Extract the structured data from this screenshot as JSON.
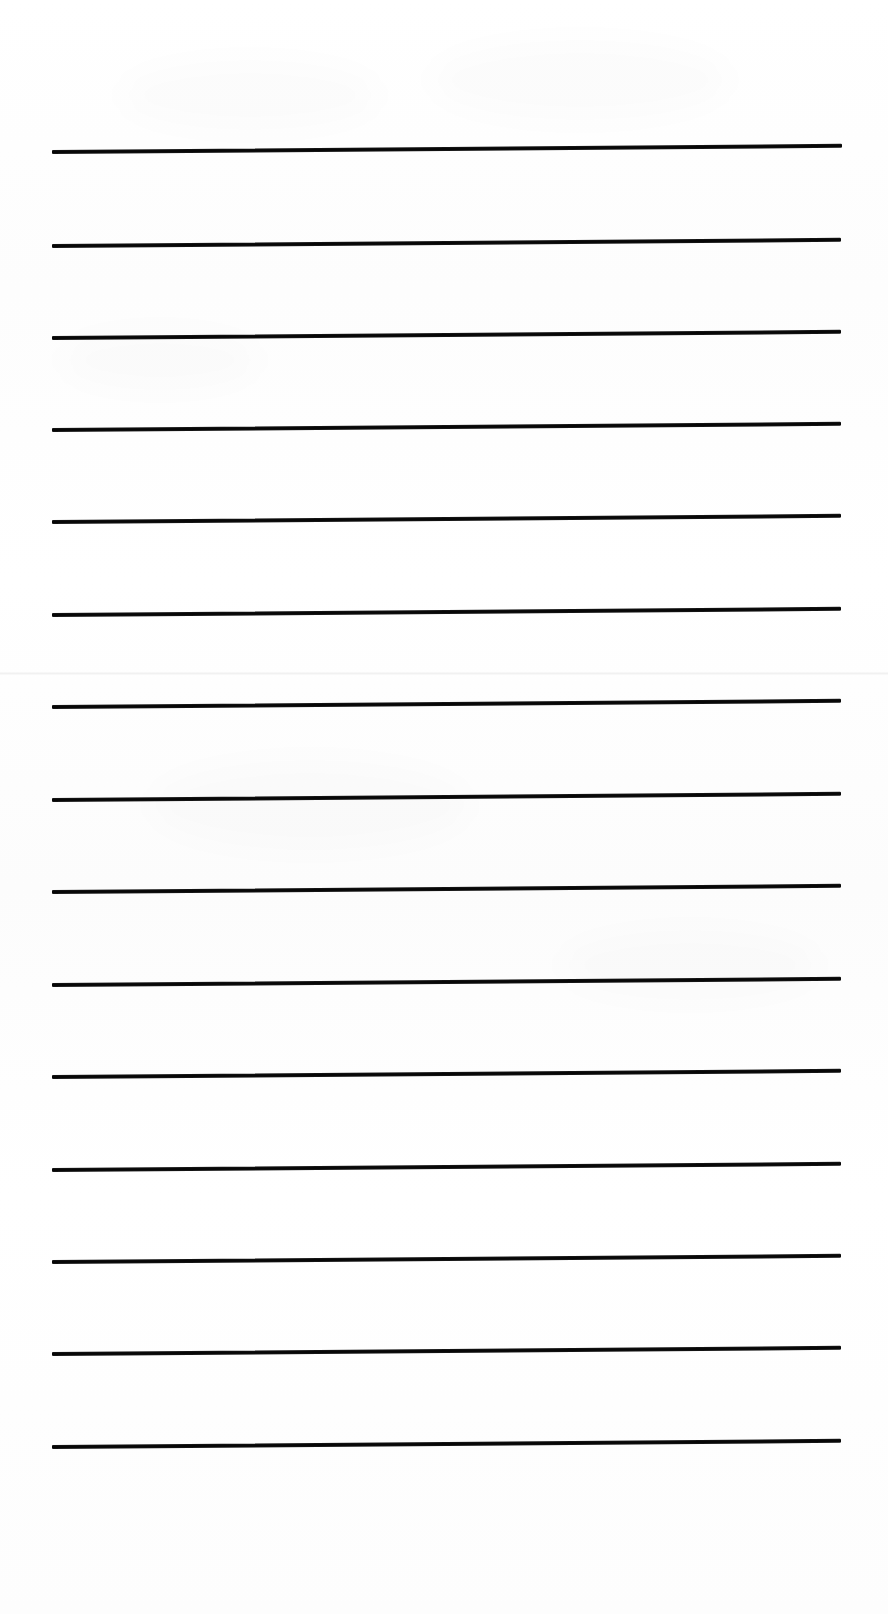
{
  "document": {
    "kind": "lined-paper-sheet",
    "title": "Blank ruled writing paper",
    "orientation": "portrait",
    "page_width": 888,
    "page_height": 1614,
    "background_color": "#ffffff",
    "ink_color": "#141414",
    "has_text_content": false,
    "has_margin_rule": false,
    "has_header": false,
    "has_footer": false
  },
  "ruling": {
    "line_count": 15,
    "line_thickness_px": 4,
    "line_spacing_px": 92.5,
    "left_margin_px": 52,
    "right_margin_px": 44,
    "top_margin_px": 148,
    "bottom_margin_px": 165,
    "tilt_degrees": -0.45,
    "line_color": "#141414",
    "lines": [
      {
        "index": 1,
        "x": 52,
        "y": 150,
        "width": 790
      },
      {
        "index": 2,
        "x": 52,
        "y": 244,
        "width": 789
      },
      {
        "index": 3,
        "x": 52,
        "y": 336,
        "width": 789
      },
      {
        "index": 4,
        "x": 52,
        "y": 428,
        "width": 789
      },
      {
        "index": 5,
        "x": 52,
        "y": 520,
        "width": 789
      },
      {
        "index": 6,
        "x": 52,
        "y": 613,
        "width": 789
      },
      {
        "index": 7,
        "x": 52,
        "y": 705,
        "width": 789
      },
      {
        "index": 8,
        "x": 52,
        "y": 798,
        "width": 789
      },
      {
        "index": 9,
        "x": 52,
        "y": 890,
        "width": 789
      },
      {
        "index": 10,
        "x": 52,
        "y": 983,
        "width": 789
      },
      {
        "index": 11,
        "x": 52,
        "y": 1075,
        "width": 789
      },
      {
        "index": 12,
        "x": 52,
        "y": 1168,
        "width": 789
      },
      {
        "index": 13,
        "x": 52,
        "y": 1260,
        "width": 789
      },
      {
        "index": 14,
        "x": 52,
        "y": 1352,
        "width": 789
      },
      {
        "index": 15,
        "x": 52,
        "y": 1445,
        "width": 789
      }
    ]
  },
  "artifacts": {
    "seam": {
      "y": 672,
      "opacity": 0.05
    },
    "blotches": [
      {
        "x": 120,
        "y": 60,
        "w": 260,
        "h": 70
      },
      {
        "x": 430,
        "y": 40,
        "w": 300,
        "h": 80
      },
      {
        "x": 150,
        "y": 760,
        "w": 320,
        "h": 90
      },
      {
        "x": 560,
        "y": 930,
        "w": 260,
        "h": 70
      },
      {
        "x": 60,
        "y": 330,
        "w": 200,
        "h": 60
      }
    ]
  }
}
